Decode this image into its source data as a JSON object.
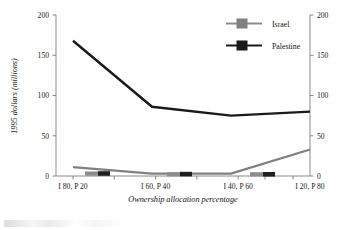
{
  "chart_data": {
    "type": "line",
    "title": "",
    "xlabel": "Ownership allocation percentage",
    "ylabel": "1995 dollars (millions)",
    "ylabel_right": "",
    "categories": [
      "I 80, P 20",
      "I 60, P 40",
      "I 40, P 60",
      "I 20, P 80"
    ],
    "ylim": [
      0,
      200
    ],
    "yticks": [
      0,
      50,
      100,
      150,
      200
    ],
    "ylim_right": [
      0,
      200
    ],
    "yticks_right": [
      0,
      50,
      100,
      150,
      200
    ],
    "grid": false,
    "legend_position": "top-right",
    "dual_axis": true,
    "series": [
      {
        "name": "Israel",
        "color": "#808080",
        "values": [
          11,
          3,
          3,
          33
        ]
      },
      {
        "name": "Palestine",
        "color": "#1a1a1a",
        "values": [
          168,
          86,
          75,
          80
        ]
      }
    ]
  },
  "axes": {
    "left": {
      "title": "1995 dollars (millions)",
      "tick_labels": [
        "200",
        "150",
        "100",
        "50",
        "0"
      ]
    },
    "right": {
      "tick_labels": [
        "200",
        "150",
        "100",
        "50",
        "0"
      ]
    },
    "bottom": {
      "title": "Ownership allocation percentage",
      "tick_labels": [
        "I 80, P 20",
        "I 60, P 40",
        "I 40, P 60",
        "I 20, P 80"
      ]
    }
  },
  "legend": {
    "entries": [
      {
        "label": "Israel",
        "color": "#808080"
      },
      {
        "label": "Palestine",
        "color": "#1a1a1a"
      }
    ]
  }
}
